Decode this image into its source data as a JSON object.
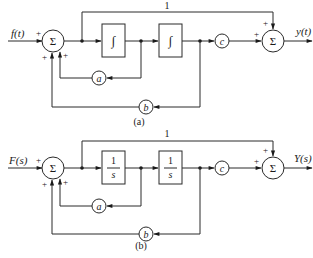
{
  "diagrams": {
    "a": {
      "caption": "(a)",
      "input_label": "f(t)",
      "output_label": "y(t)",
      "feedforward_gain": "1",
      "sum1_symbol": "Σ",
      "sum2_symbol": "Σ",
      "block1": "∫",
      "block2": "∫",
      "gain_a": "a",
      "gain_b": "b",
      "gain_c": "c",
      "signs": {
        "sum1_input": "+",
        "sum1_fb_b": "+",
        "sum1_fb_a": "+",
        "sum2_c": "+",
        "sum2_top": "+"
      }
    },
    "b": {
      "caption": "(b)",
      "input_label": "F(s)",
      "output_label": "Y(s)",
      "feedforward_gain": "1",
      "sum1_symbol": "Σ",
      "sum2_symbol": "Σ",
      "block1_num": "1",
      "block1_den": "s",
      "block2_num": "1",
      "block2_den": "s",
      "gain_a": "a",
      "gain_b": "b",
      "gain_c": "c",
      "signs": {
        "sum1_input": "+",
        "sum1_fb_b": "+",
        "sum1_fb_a": "+",
        "sum2_c": "+",
        "sum2_top": "+"
      }
    }
  }
}
